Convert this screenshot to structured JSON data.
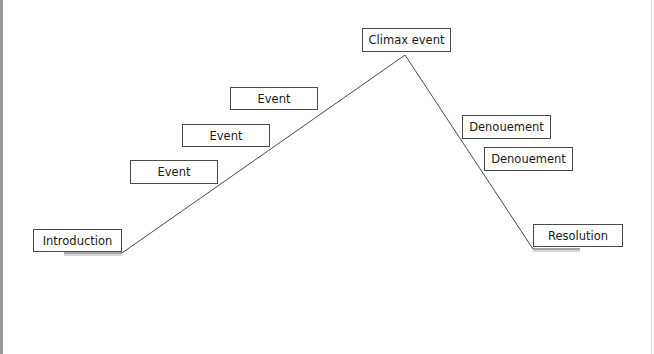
{
  "diagram": {
    "type": "plot-diagram",
    "line_color": "#4a4a4a",
    "labels": {
      "introduction": "Introduction",
      "event_1": "Event",
      "event_2": "Event",
      "event_3": "Event",
      "climax": "Climax event",
      "denouement_1": "Denouement",
      "denouement_2": "Denouement",
      "resolution": "Resolution"
    }
  }
}
